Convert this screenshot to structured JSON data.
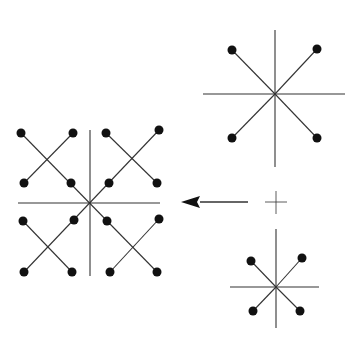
{
  "diagram": {
    "background": "#ffffff",
    "stroke_color": "#333333",
    "dot_color": "#111111",
    "dot_radius": 4.5,
    "figures": [
      {
        "name": "large-star",
        "center": [
          275,
          94
        ],
        "axes": {
          "h": [
            203,
            345
          ],
          "v": [
            30,
            167
          ]
        },
        "spokes": [
          [
            232,
            50
          ],
          [
            317,
            49
          ],
          [
            232,
            138
          ],
          [
            317,
            138
          ]
        ]
      },
      {
        "name": "small-star",
        "center": [
          276,
          287
        ],
        "axes": {
          "h": [
            230,
            319
          ],
          "v": [
            229,
            328
          ]
        },
        "spokes": [
          [
            251,
            261
          ],
          [
            302,
            258
          ],
          [
            253,
            311
          ],
          [
            300,
            311
          ]
        ]
      },
      {
        "name": "composite-pattern",
        "center": [
          90,
          203
        ],
        "axes": {
          "h": [
            18,
            160
          ],
          "v": [
            130,
            276
          ]
        },
        "lines": [
          [
            [
              21,
              133
            ],
            [
              157,
              272
            ]
          ],
          [
            [
              159,
              130
            ],
            [
              24,
              272
            ]
          ],
          [
            [
              73,
              133
            ],
            [
              24,
              183
            ]
          ],
          [
            [
              106,
              133
            ],
            [
              157,
              183
            ]
          ],
          [
            [
              23,
              221
            ],
            [
              72,
              272
            ]
          ],
          [
            [
              159,
              219
            ],
            [
              110,
              272
            ]
          ]
        ],
        "dots": [
          [
            21,
            133
          ],
          [
            73,
            133
          ],
          [
            24,
            183
          ],
          [
            71,
            183
          ],
          [
            106,
            133
          ],
          [
            159,
            130
          ],
          [
            109,
            183
          ],
          [
            157,
            183
          ],
          [
            23,
            221
          ],
          [
            74,
            220
          ],
          [
            24,
            272
          ],
          [
            72,
            272
          ],
          [
            107,
            221
          ],
          [
            159,
            219
          ],
          [
            110,
            272
          ],
          [
            157,
            272
          ]
        ]
      }
    ],
    "arrow": {
      "from": [
        248,
        202
      ],
      "to": [
        181,
        202
      ],
      "head_base_x": 200
    },
    "small_cross": {
      "center": [
        276,
        202
      ],
      "h": [
        265,
        287
      ],
      "v": [
        191,
        214
      ]
    }
  }
}
